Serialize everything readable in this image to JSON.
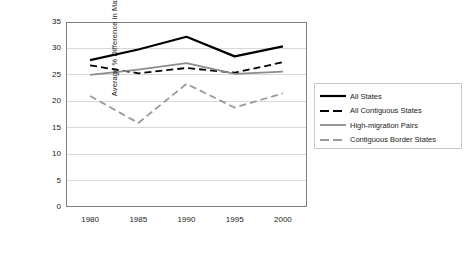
{
  "chart_data": {
    "type": "line",
    "title": "",
    "xlabel": "",
    "ylabel": "Average % Difference in Matched Pairs",
    "categories": [
      "1980",
      "1985",
      "1990",
      "1995",
      "2000"
    ],
    "x": [
      1980,
      1985,
      1990,
      1995,
      2000
    ],
    "ylim": [
      0,
      35
    ],
    "ytick_step": 5,
    "yticks": [
      "0",
      "5",
      "10",
      "15",
      "20",
      "25",
      "30",
      "35"
    ],
    "grid": "horizontal",
    "legend_position": "right",
    "series": [
      {
        "name": "All States",
        "values": [
          27.8,
          29.8,
          32.2,
          28.5,
          30.4
        ],
        "color": "#000000",
        "style": "solid",
        "width": 2.2
      },
      {
        "name": "All Contiguous States",
        "values": [
          26.8,
          25.3,
          26.3,
          25.4,
          27.4
        ],
        "color": "#000000",
        "style": "dashed",
        "width": 1.8
      },
      {
        "name": "High-migration Pairs",
        "values": [
          25.0,
          26.0,
          27.2,
          25.2,
          25.6
        ],
        "color": "#8c8c8c",
        "style": "solid",
        "width": 1.8
      },
      {
        "name": "Contiguous Border States",
        "values": [
          21.0,
          15.9,
          23.3,
          18.8,
          21.5
        ],
        "color": "#9a9a9a",
        "style": "dashed",
        "width": 1.8
      }
    ]
  },
  "legend": {
    "items": [
      {
        "label": "All States"
      },
      {
        "label": "All Contiguous States"
      },
      {
        "label": "High-migration Pairs"
      },
      {
        "label": "Contiguous Border States"
      }
    ]
  },
  "colors": {
    "plot_border": "#808080",
    "gridline": "#d9d9d9",
    "legend_border": "#c8c8c8",
    "background": "#ffffff",
    "text": "#1a1a1a"
  }
}
